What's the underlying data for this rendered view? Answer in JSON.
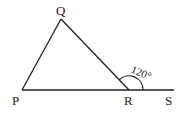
{
  "diagram": {
    "type": "triangle-exterior-angle",
    "points": {
      "P": {
        "label": "P",
        "x": 22,
        "y": 90
      },
      "Q": {
        "label": "Q",
        "x": 61,
        "y": 19
      },
      "R": {
        "label": "R",
        "x": 129,
        "y": 90
      },
      "S": {
        "label": "S",
        "x": 174,
        "y": 90
      }
    },
    "segments": [
      "PQ",
      "QR",
      "PR",
      "RS"
    ],
    "exterior_angle": {
      "vertex": "R",
      "between": [
        "Q",
        "S"
      ],
      "value": "120°"
    },
    "colors": {
      "stroke": "#222222",
      "background": "#ffffff"
    }
  }
}
